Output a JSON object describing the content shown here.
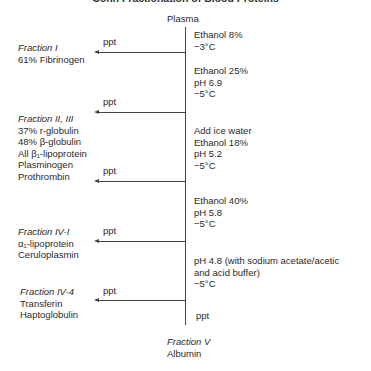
{
  "title": "Cohn Fractionation of Blood Proteins",
  "start": "Plasma",
  "steps": [
    {
      "lines": [
        "Ethanol 8%",
        "−3°C"
      ]
    },
    {
      "lines": [
        "Ethanol 25%",
        "pH 6.9",
        "−5°C"
      ]
    },
    {
      "lines": [
        "Add ice water",
        "Ethanol 18%",
        "pH 5.2",
        "−5°C"
      ]
    },
    {
      "lines": [
        "Ethanol 40%",
        "pH 5.8",
        "−5°C"
      ]
    },
    {
      "lines": [
        "pH 4.8 (with sodium acetate/acetic",
        "and acid buffer)",
        "−5°C"
      ]
    }
  ],
  "ppt_label": "ppt",
  "fractions": [
    {
      "name": "Fraction I",
      "contents": [
        "61% Fibrinogen"
      ]
    },
    {
      "name": "Fraction II, III",
      "contents": [
        "37% r-globulin",
        "48% β-globulin",
        "All β₁-lipoprotein",
        "Plasminogen",
        "Prothrombin"
      ]
    },
    {
      "name": "Fraction IV-I",
      "contents": [
        "α₁-lipoprotein",
        "Ceruloplasmin"
      ]
    },
    {
      "name": "Fraction IV-4",
      "contents": [
        "Transferin",
        "Haptoglobulin"
      ]
    }
  ],
  "final": {
    "ppt": "ppt",
    "name": "Fraction V",
    "contents": [
      "Albumin"
    ]
  }
}
